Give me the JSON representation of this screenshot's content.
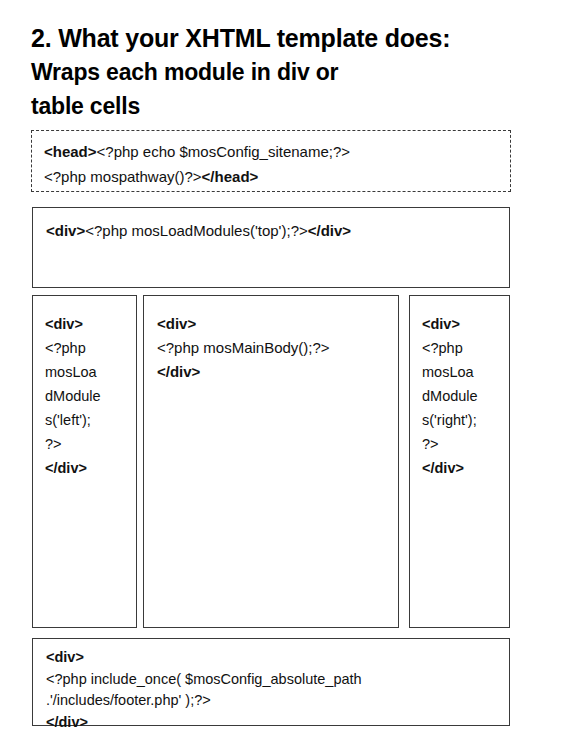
{
  "slide": {
    "title": {
      "line1": "2. What your XHTML template does:",
      "line2": "Wraps each module in div or",
      "line3": "table cells"
    },
    "boxes": {
      "head": {
        "name": "head-section",
        "border_style": "dashed",
        "lines": [
          {
            "bold_prefix": "<head>",
            "text": "<?php echo $mosConfig_sitename;?>",
            "bold_suffix": ""
          },
          {
            "bold_prefix": "",
            "text": "<?php mospathway()?>",
            "bold_suffix": "</head>"
          }
        ]
      },
      "top": {
        "name": "top-module",
        "border_style": "solid",
        "lines": [
          {
            "bold_prefix": "<div>",
            "text": "<?php mosLoadModules('top');?>",
            "bold_suffix": "</div>"
          }
        ]
      },
      "left": {
        "name": "left-module",
        "border_style": "solid",
        "lines": [
          {
            "bold_prefix": "<div>",
            "text": "",
            "bold_suffix": ""
          },
          {
            "bold_prefix": "",
            "text": "<?php",
            "bold_suffix": ""
          },
          {
            "bold_prefix": "",
            "text": "mosLoa",
            "bold_suffix": ""
          },
          {
            "bold_prefix": "",
            "text": "dModule",
            "bold_suffix": ""
          },
          {
            "bold_prefix": "",
            "text": "s('left');",
            "bold_suffix": ""
          },
          {
            "bold_prefix": "",
            "text": "?>",
            "bold_suffix": ""
          },
          {
            "bold_prefix": "</div>",
            "text": "",
            "bold_suffix": ""
          }
        ]
      },
      "center": {
        "name": "main-body-module",
        "border_style": "solid",
        "lines": [
          {
            "bold_prefix": "<div>",
            "text": "",
            "bold_suffix": ""
          },
          {
            "bold_prefix": "",
            "text": "<?php mosMainBody();?>",
            "bold_suffix": ""
          },
          {
            "bold_prefix": "</div>",
            "text": "",
            "bold_suffix": ""
          }
        ]
      },
      "right": {
        "name": "right-module",
        "border_style": "solid",
        "lines": [
          {
            "bold_prefix": "<div>",
            "text": "",
            "bold_suffix": ""
          },
          {
            "bold_prefix": "",
            "text": "<?php",
            "bold_suffix": ""
          },
          {
            "bold_prefix": "",
            "text": "mosLoa",
            "bold_suffix": ""
          },
          {
            "bold_prefix": "",
            "text": "dModule",
            "bold_suffix": ""
          },
          {
            "bold_prefix": "",
            "text": "s('right');",
            "bold_suffix": ""
          },
          {
            "bold_prefix": "",
            "text": "?>",
            "bold_suffix": ""
          },
          {
            "bold_prefix": "</div>",
            "text": "",
            "bold_suffix": ""
          }
        ]
      },
      "footer": {
        "name": "footer-module",
        "border_style": "solid",
        "lines": [
          {
            "bold_prefix": "<div>",
            "text": "",
            "bold_suffix": ""
          },
          {
            "bold_prefix": "",
            "text": "<?php include_once( $mosConfig_absolute_path",
            "bold_suffix": ""
          },
          {
            "bold_prefix": "",
            "text": ".'/includes/footer.php' );?>",
            "bold_suffix": ""
          },
          {
            "bold_prefix": "</div>",
            "text": "",
            "bold_suffix": ""
          }
        ]
      }
    }
  },
  "colors": {
    "page_background": "#ffffff",
    "text": "#000000",
    "border": "#3a3a3a",
    "slide_border": "#2b2b2b"
  }
}
